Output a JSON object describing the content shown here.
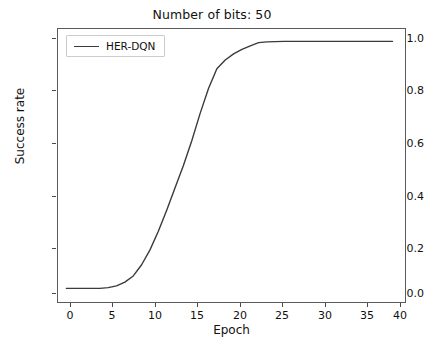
{
  "chart_data": {
    "type": "line",
    "title": "Number of bits: 50",
    "xlabel": "Epoch",
    "ylabel": "Success rate",
    "xlim": [
      -1.0,
      40.5
    ],
    "ylim": [
      -0.05,
      1.05
    ],
    "xticks": [
      0,
      5,
      10,
      15,
      20,
      25,
      30,
      35,
      40
    ],
    "xtick_labels": [
      "0",
      "5",
      "10",
      "15",
      "20",
      "25",
      "30",
      "35",
      "40"
    ],
    "yticks": [
      0.0,
      0.2,
      0.4,
      0.6,
      0.8,
      1.0
    ],
    "ytick_labels": [
      "0.0",
      "0.2",
      "0.4",
      "0.6",
      "0.8",
      "1.0"
    ],
    "grid": false,
    "legend_position": "upper left",
    "line_color": "#3a3a3a",
    "line_width": 1.4,
    "series": [
      {
        "name": "HER-DQN",
        "x": [
          0,
          1,
          2,
          3,
          4,
          5,
          6,
          7,
          8,
          9,
          10,
          11,
          12,
          13,
          14,
          15,
          16,
          17,
          18,
          19,
          20,
          21,
          22,
          23,
          24,
          25,
          26,
          27,
          28,
          29,
          30,
          31,
          32,
          33,
          34,
          35,
          36,
          37,
          38,
          39
        ],
        "values": [
          0.005,
          0.005,
          0.005,
          0.005,
          0.005,
          0.008,
          0.015,
          0.03,
          0.055,
          0.1,
          0.16,
          0.235,
          0.32,
          0.41,
          0.5,
          0.6,
          0.71,
          0.81,
          0.89,
          0.925,
          0.95,
          0.968,
          0.982,
          0.995,
          0.998,
          0.999,
          1.0,
          1.0,
          1.0,
          1.0,
          1.0,
          1.0,
          1.0,
          1.0,
          1.0,
          1.0,
          1.0,
          1.0,
          1.0,
          1.0
        ]
      }
    ]
  },
  "legend": {
    "entries": [
      {
        "label": "HER-DQN",
        "color": "#3a3a3a"
      }
    ]
  }
}
